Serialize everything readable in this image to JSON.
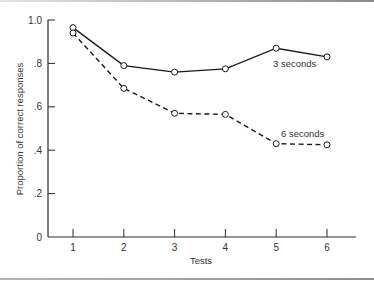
{
  "chart_data": {
    "type": "line",
    "title": "",
    "xlabel": "Tests",
    "ylabel": "Proportion of correct responses",
    "x": [
      1,
      2,
      3,
      4,
      5,
      6
    ],
    "x_tick_labels": [
      "1",
      "2",
      "3",
      "4",
      "5",
      "6"
    ],
    "y_tick_values": [
      0,
      0.2,
      0.4,
      0.6,
      0.8,
      1.0
    ],
    "y_tick_labels": [
      "0",
      ".2",
      ".4",
      ".6",
      ".8",
      "1.0"
    ],
    "ylim": [
      0,
      1.0
    ],
    "xlim": [
      0.5,
      6.7
    ],
    "grid": false,
    "legend_position": "inline labels near lines",
    "series": [
      {
        "name": "3 seconds",
        "style": "solid",
        "marker": "open-circle",
        "values": [
          0.965,
          0.79,
          0.76,
          0.775,
          0.87,
          0.83
        ]
      },
      {
        "name": "6 seconds",
        "style": "dashed",
        "marker": "open-circle",
        "values": [
          0.94,
          0.685,
          0.57,
          0.565,
          0.43,
          0.425
        ]
      }
    ]
  },
  "labels": {
    "series_3s": "3 seconds",
    "series_6s": "6 seconds",
    "xlabel": "Tests",
    "ylabel": "Proportion of correct responses"
  },
  "colors": {
    "line": "#1a1a1a",
    "axis": "#2a2a2a",
    "text": "#333333"
  }
}
